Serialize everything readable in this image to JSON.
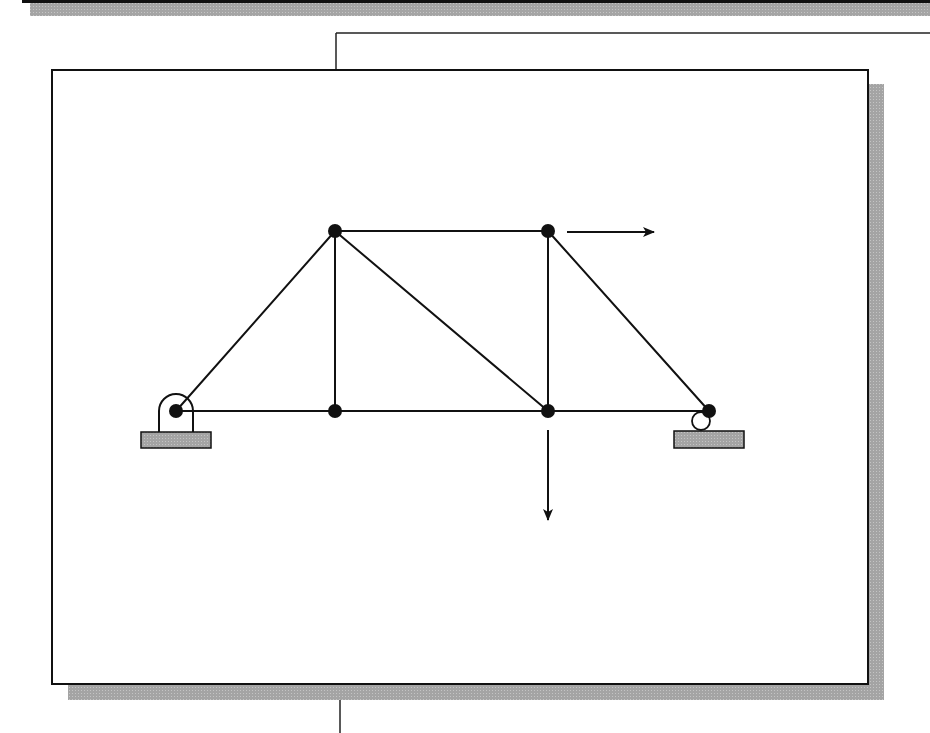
{
  "diagram": {
    "type": "truss",
    "colors": {
      "line": "#111111",
      "shadow": "#a8a8a8",
      "support": "#8c8c8c",
      "background": "#ffffff"
    },
    "frame": {
      "x": 52,
      "y": 70,
      "width": 816,
      "height": 614
    },
    "joints": [
      {
        "id": "A",
        "x": 176,
        "y": 411
      },
      {
        "id": "B",
        "x": 335,
        "y": 231
      },
      {
        "id": "C",
        "x": 335,
        "y": 411
      },
      {
        "id": "D",
        "x": 548,
        "y": 231
      },
      {
        "id": "E",
        "x": 548,
        "y": 411
      },
      {
        "id": "F",
        "x": 709,
        "y": 411
      }
    ],
    "members": [
      [
        "A",
        "B"
      ],
      [
        "A",
        "C"
      ],
      [
        "B",
        "C"
      ],
      [
        "B",
        "D"
      ],
      [
        "B",
        "E"
      ],
      [
        "C",
        "E"
      ],
      [
        "D",
        "E"
      ],
      [
        "D",
        "F"
      ],
      [
        "E",
        "F"
      ]
    ],
    "supports": [
      {
        "joint": "A",
        "type": "pin"
      },
      {
        "joint": "F",
        "type": "roller"
      }
    ],
    "loads": [
      {
        "joint": "D",
        "direction": "right"
      },
      {
        "joint": "E",
        "direction": "down"
      }
    ]
  }
}
